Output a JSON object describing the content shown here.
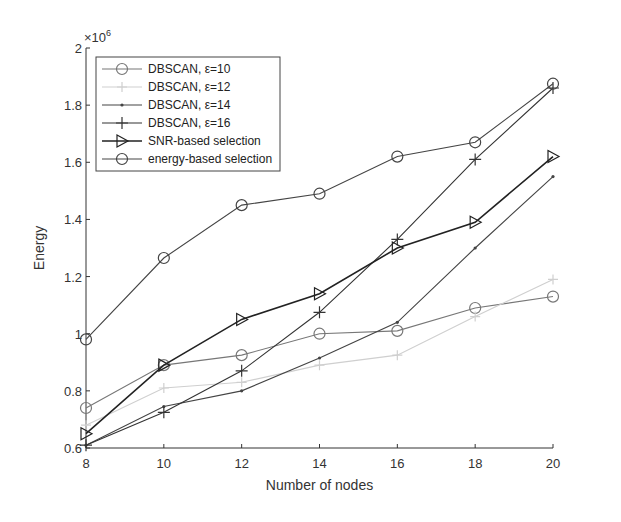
{
  "chart_data": {
    "type": "line",
    "title": "",
    "xlabel": "Number of nodes",
    "ylabel": "Energy",
    "y_multiplier": "×10^6",
    "x": [
      8,
      10,
      12,
      14,
      16,
      18,
      20
    ],
    "xlim": [
      8,
      20
    ],
    "ylim": [
      0.6,
      2.0
    ],
    "x_ticks": [
      "8",
      "10",
      "12",
      "14",
      "16",
      "18",
      "20"
    ],
    "y_ticks": [
      "0.6",
      "0.8",
      "1",
      "1.2",
      "1.4",
      "1.6",
      "1.8",
      "2"
    ],
    "grid": false,
    "legend_position": "upper left",
    "series": [
      {
        "name": "DBSCAN, ε=10",
        "marker": "circle",
        "color": "#777777",
        "values": [
          0.74,
          0.89,
          0.925,
          1.0,
          1.01,
          1.09,
          1.13
        ]
      },
      {
        "name": "DBSCAN, ε=12",
        "marker": "cross",
        "color": "#cfcfcf",
        "values": [
          0.68,
          0.81,
          0.83,
          0.89,
          0.925,
          1.06,
          1.19
        ]
      },
      {
        "name": "DBSCAN, ε=14",
        "marker": "dot",
        "color": "#444444",
        "values": [
          0.61,
          0.745,
          0.8,
          0.915,
          1.04,
          1.3,
          1.55
        ]
      },
      {
        "name": "DBSCAN, ε=16",
        "marker": "plus",
        "color": "#333333",
        "values": [
          0.61,
          0.725,
          0.87,
          1.075,
          1.33,
          1.61,
          1.86
        ]
      },
      {
        "name": "SNR-based selection",
        "marker": "triangle-right",
        "color": "#222222",
        "values": [
          0.65,
          0.89,
          1.05,
          1.14,
          1.3,
          1.39,
          1.62
        ]
      },
      {
        "name": "energy-based selection",
        "marker": "circle",
        "color": "#444444",
        "values": [
          0.98,
          1.265,
          1.45,
          1.49,
          1.62,
          1.67,
          1.875
        ]
      }
    ]
  }
}
